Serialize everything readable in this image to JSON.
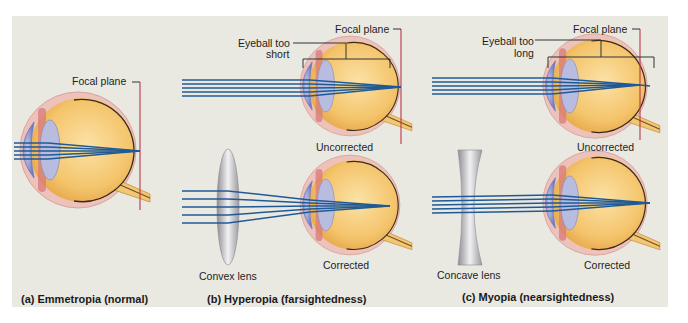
{
  "figure": {
    "panels": [
      {
        "id": "a",
        "caption": "(a) Emmetropia (normal)",
        "labels": {
          "focal_plane": "Focal plane"
        }
      },
      {
        "id": "b",
        "caption": "(b) Hyperopia (farsightedness)",
        "labels": {
          "focal_plane": "Focal plane",
          "eyeball_line1": "Eyeball too",
          "eyeball_line2": "short",
          "uncorrected": "Uncorrected",
          "corrected": "Corrected",
          "lens": "Convex lens"
        }
      },
      {
        "id": "c",
        "caption": "(c) Myopia (nearsightedness)",
        "labels": {
          "focal_plane": "Focal plane",
          "eyeball_line1": "Eyeball too",
          "eyeball_line2": "long",
          "uncorrected": "Uncorrected",
          "corrected": "Corrected",
          "lens": "Concave lens"
        }
      }
    ],
    "colors": {
      "background": "#e9e9e2",
      "ray": "#1f5a96",
      "focal_plane": "#b8374a",
      "eyeball_fill": "#f2c46a",
      "sclera": "#e7b5ae",
      "cornea": "#8f97d0"
    }
  }
}
